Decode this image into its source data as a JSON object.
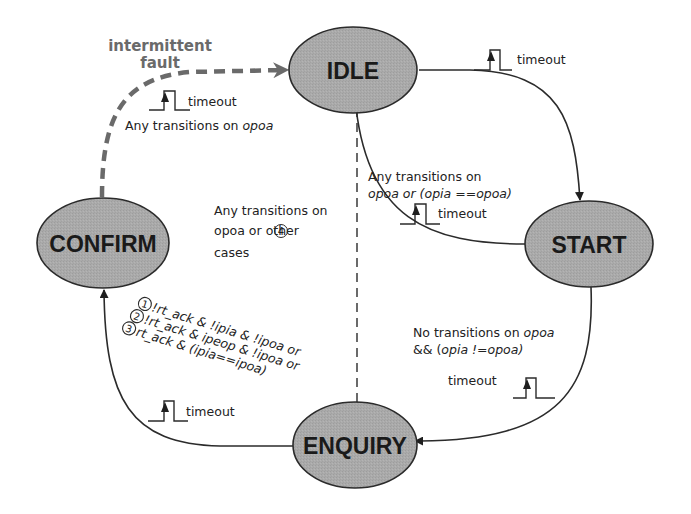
{
  "diagram": {
    "type": "state-machine",
    "colors": {
      "state_fill": "#a9a9a9",
      "state_stroke": "#2b2b2b",
      "edge": "#2b2b2b",
      "fault_edge": "#6a6a6a",
      "text": "#1a1a1a",
      "fault_text": "#6a6a6a"
    },
    "states": {
      "idle": "IDLE",
      "start": "START",
      "enquiry": "ENQUIRY",
      "confirm": "CONFIRM"
    },
    "edges": {
      "idle_to_start": {
        "timeout_label": "timeout"
      },
      "start_to_idle": {
        "line1": "Any transitions on",
        "line2": "opoa or (opia ==opoa)",
        "timeout_label": "timeout"
      },
      "start_to_enquiry": {
        "line1_plain": "No transitions on ",
        "line1_italic": "opoa",
        "line2_plain": "&& (",
        "line2_italic": "opia !=opoa)",
        "timeout_label": "timeout"
      },
      "enquiry_to_idle": {
        "line1": "Any transitions on",
        "line2_a": "opoa or ",
        "line2_num": "4",
        "line2_b": " other",
        "line3": "cases"
      },
      "enquiry_to_confirm": {
        "timeout_label": "timeout",
        "conditions": [
          {
            "num": "1",
            "text": "!rt_ack & !ipia & !ipoa or"
          },
          {
            "num": "2",
            "text": "!rt_ack & ipeop & !ipoa or"
          },
          {
            "num": "3",
            "text": "rt_ack & (ipia==ipoa)"
          }
        ]
      },
      "confirm_to_idle": {
        "fault_line1": "intermittent",
        "fault_line2": "fault",
        "timeout_label": "timeout",
        "line_plain": "Any transitions on ",
        "line_italic": "opoa"
      }
    }
  }
}
